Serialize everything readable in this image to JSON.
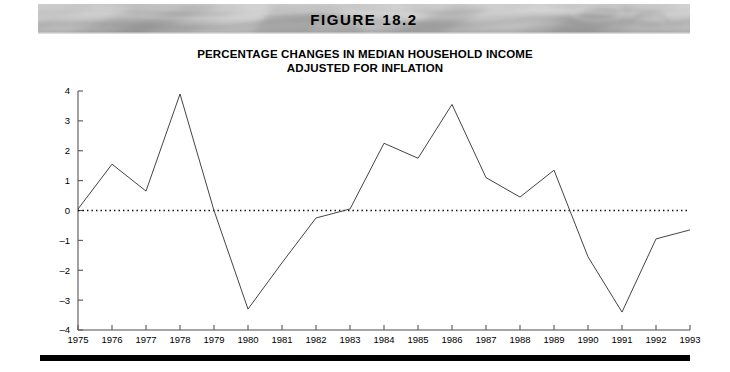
{
  "figure": {
    "banner_label": "FIGURE 18.2",
    "banner_texture": "marble-grayscale-texture"
  },
  "chart_data": {
    "type": "line",
    "title": "PERCENTAGE CHANGES IN MEDIAN HOUSEHOLD INCOME ADJUSTED FOR INFLATION",
    "title_line1": "PERCENTAGE CHANGES IN MEDIAN HOUSEHOLD INCOME",
    "title_line2": "ADJUSTED FOR INFLATION",
    "xlabel": "",
    "ylabel": "Change in Income (percent)",
    "xlim": [
      1975,
      1993
    ],
    "ylim": [
      -4,
      4
    ],
    "grid": false,
    "legend": "none",
    "zero_reference_line": true,
    "zero_reference_style": "dotted",
    "line_color": "#444444",
    "x": [
      1975,
      1976,
      1977,
      1978,
      1979,
      1980,
      1981,
      1982,
      1983,
      1984,
      1985,
      1986,
      1987,
      1988,
      1989,
      1990,
      1991,
      1992,
      1993
    ],
    "xtick_labels": [
      "1975",
      "1976",
      "1977",
      "1978",
      "1979",
      "1980",
      "1981",
      "1982",
      "1983",
      "1984",
      "1985",
      "1986",
      "1987",
      "1988",
      "1989",
      "1990",
      "1991",
      "1992",
      "1993"
    ],
    "ytick_labels": [
      "4",
      "3",
      "2",
      "1",
      "0",
      "-1",
      "-2",
      "-3",
      "-4"
    ],
    "ytick_values": [
      4,
      3,
      2,
      1,
      0,
      -1,
      -2,
      -3,
      -4
    ],
    "series": [
      {
        "name": "Change in median household income",
        "values": [
          0.05,
          1.55,
          0.65,
          3.9,
          0.0,
          -3.3,
          -1.75,
          -0.25,
          0.05,
          2.25,
          1.75,
          3.55,
          1.1,
          0.45,
          1.35,
          -1.55,
          -3.4,
          -0.95,
          -0.65
        ]
      }
    ]
  }
}
